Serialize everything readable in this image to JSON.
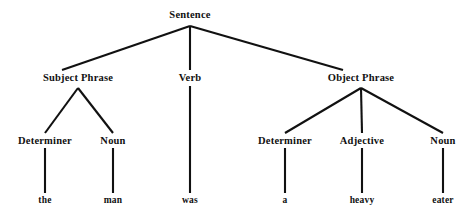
{
  "figure": {
    "name": "syntax-parse-tree",
    "sentence": "the man was a heavy eater",
    "ink_color": "#111111",
    "background_color": "#ffffff"
  },
  "nodes": {
    "root": {
      "label": "Sentence",
      "x": 190,
      "y": 15
    },
    "level2": [
      {
        "label": "Subject Phrase",
        "x": 78,
        "y": 78
      },
      {
        "label": "Verb",
        "x": 190,
        "y": 78
      },
      {
        "label": "Object Phrase",
        "x": 361,
        "y": 78
      }
    ],
    "level3": [
      {
        "label": "Determiner",
        "x": 45,
        "y": 141
      },
      {
        "label": "Noun",
        "x": 113,
        "y": 141
      },
      {
        "label": "Determiner",
        "x": 285,
        "y": 141
      },
      {
        "label": "Adjective",
        "x": 362,
        "y": 141
      },
      {
        "label": "Noun",
        "x": 443,
        "y": 141
      }
    ],
    "leaves": [
      {
        "label": "the",
        "x": 45,
        "y": 201
      },
      {
        "label": "man",
        "x": 113,
        "y": 201
      },
      {
        "label": "was",
        "x": 190,
        "y": 201
      },
      {
        "label": "a",
        "x": 285,
        "y": 201
      },
      {
        "label": "heavy",
        "x": 362,
        "y": 201
      },
      {
        "label": "eater",
        "x": 443,
        "y": 201
      }
    ]
  },
  "edges": [
    {
      "from": "Sentence",
      "to": "Subject Phrase",
      "x1": 190,
      "y1": 26,
      "x2": 62,
      "y2": 70
    },
    {
      "from": "Sentence",
      "to": "Verb",
      "x1": 190,
      "y1": 26,
      "x2": 190,
      "y2": 70
    },
    {
      "from": "Sentence",
      "to": "Object Phrase",
      "x1": 190,
      "y1": 26,
      "x2": 343,
      "y2": 70
    },
    {
      "from": "Subject Phrase",
      "to": "Determiner",
      "x1": 78,
      "y1": 88,
      "x2": 45,
      "y2": 133
    },
    {
      "from": "Subject Phrase",
      "to": "Noun",
      "x1": 78,
      "y1": 88,
      "x2": 113,
      "y2": 133
    },
    {
      "from": "Verb",
      "to": "was",
      "x1": 190,
      "y1": 86,
      "x2": 190,
      "y2": 193
    },
    {
      "from": "Object Phrase",
      "to": "Determiner",
      "x1": 361,
      "y1": 88,
      "x2": 285,
      "y2": 133
    },
    {
      "from": "Object Phrase",
      "to": "Adjective",
      "x1": 361,
      "y1": 88,
      "x2": 362,
      "y2": 133
    },
    {
      "from": "Object Phrase",
      "to": "Noun",
      "x1": 361,
      "y1": 88,
      "x2": 443,
      "y2": 133
    },
    {
      "from": "Determiner",
      "to": "the",
      "x1": 45,
      "y1": 148,
      "x2": 45,
      "y2": 193
    },
    {
      "from": "Noun",
      "to": "man",
      "x1": 113,
      "y1": 148,
      "x2": 113,
      "y2": 193
    },
    {
      "from": "Determiner",
      "to": "a",
      "x1": 285,
      "y1": 148,
      "x2": 285,
      "y2": 193
    },
    {
      "from": "Adjective",
      "to": "heavy",
      "x1": 362,
      "y1": 148,
      "x2": 362,
      "y2": 193
    },
    {
      "from": "Noun",
      "to": "eater",
      "x1": 443,
      "y1": 148,
      "x2": 443,
      "y2": 193
    }
  ]
}
